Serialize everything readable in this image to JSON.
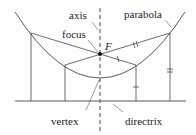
{
  "diagram": {
    "labels": {
      "axis": "axis",
      "parabola": "parabola",
      "focus": "focus",
      "focus_point": "F",
      "vertex": "vertex",
      "directrix": "directrix"
    },
    "colors": {
      "stroke": "#333333",
      "background": "#ffffff"
    }
  }
}
